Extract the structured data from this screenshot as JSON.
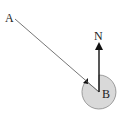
{
  "diagram": {
    "type": "bearing-diagram",
    "labels": {
      "point_a": "A",
      "point_b": "B",
      "north": "N"
    },
    "colors": {
      "line": "#555555",
      "arrow": "#111111",
      "circle_fill": "#d9d9d9",
      "circle_stroke": "#888888"
    }
  }
}
